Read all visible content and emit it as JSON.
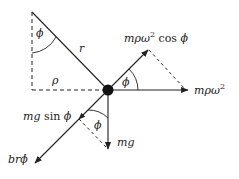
{
  "diagram": {
    "labels": {
      "phi_top": "ϕ",
      "r": "r",
      "rho": "ρ",
      "phi_right": "ϕ",
      "phi_bottom": "ϕ",
      "cent_comp_m": "mρω",
      "cent_comp_sup": "2",
      "cent_comp_cos": " cos ",
      "cent_comp_phi": "ϕ",
      "cent_m": "mρω",
      "cent_sup": "2",
      "grav_comp_m": "mg",
      "grav_comp_sin": " sin ",
      "grav_comp_phi": "ϕ",
      "grav": "mg",
      "drag": "br",
      "drag_phi": "ϕ̇"
    },
    "colors": {
      "stroke": "#222222",
      "mass": "#111111"
    }
  }
}
